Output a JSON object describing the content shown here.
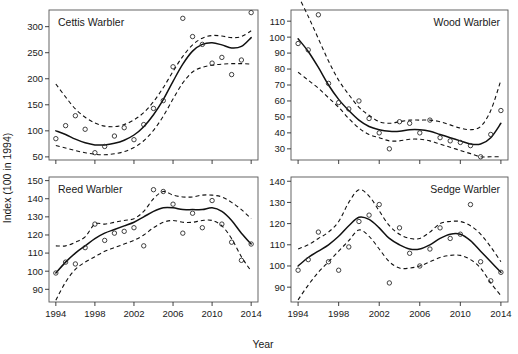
{
  "figure": {
    "xlabel": "Year",
    "ylabel": "Index (100 in 1994)",
    "background": "#ffffff",
    "line_color": "#111111",
    "point_color": "#2b2b2b"
  },
  "chart_data": [
    {
      "type": "scatter",
      "title": "Cettis Warbler",
      "panel": "top-left",
      "xlabel": "Year",
      "ylabel": "Index (100 in 1994)",
      "xlim": [
        1993.3,
        2014.7
      ],
      "ylim": [
        44,
        332
      ],
      "xticks": [
        1994,
        1998,
        2002,
        2006,
        2010,
        2014
      ],
      "yticks": [
        50,
        100,
        150,
        200,
        250,
        300
      ],
      "grid": false,
      "legend": "none",
      "x": [
        1994,
        1995,
        1996,
        1997,
        1998,
        1999,
        2000,
        2001,
        2002,
        2003,
        2004,
        2005,
        2006,
        2007,
        2008,
        2009,
        2010,
        2011,
        2012,
        2013,
        2014
      ],
      "points": [
        85,
        110,
        129,
        103,
        58,
        70,
        90,
        106,
        83,
        112,
        143,
        158,
        223,
        316,
        281,
        266,
        230,
        241,
        208,
        236,
        327
      ],
      "fit": [
        100,
        93,
        84,
        77,
        73,
        73,
        76,
        82,
        92,
        108,
        131,
        160,
        195,
        228,
        253,
        266,
        269,
        265,
        259,
        262,
        279
      ],
      "ci_upper": [
        190,
        165,
        142,
        126,
        115,
        109,
        108,
        112,
        121,
        135,
        156,
        183,
        214,
        243,
        265,
        278,
        283,
        282,
        279,
        281,
        292
      ],
      "ci_lower": [
        72,
        67,
        62,
        58,
        55,
        54,
        56,
        60,
        68,
        81,
        101,
        128,
        161,
        192,
        213,
        222,
        226,
        228,
        229,
        229,
        228
      ]
    },
    {
      "type": "scatter",
      "title": "Wood Warbler",
      "panel": "top-right",
      "xlabel": "Year",
      "ylabel": "Index (100 in 1994)",
      "xlim": [
        1993.3,
        2014.7
      ],
      "ylim": [
        23,
        117
      ],
      "xticks": [
        1994,
        1998,
        2002,
        2006,
        2010,
        2014
      ],
      "yticks": [
        30,
        40,
        50,
        60,
        70,
        80,
        90,
        100,
        110
      ],
      "grid": false,
      "legend": "none",
      "x": [
        1994,
        1995,
        1996,
        1997,
        1998,
        1999,
        2000,
        2001,
        2002,
        2003,
        2004,
        2005,
        2006,
        2007,
        2008,
        2009,
        2010,
        2011,
        2012,
        2013,
        2014
      ],
      "points": [
        96,
        92,
        114,
        71,
        59,
        55,
        60,
        49,
        40,
        30,
        47,
        46,
        40,
        48,
        37,
        35,
        34,
        32,
        25,
        39,
        54
      ],
      "fit": [
        99,
        91,
        81,
        70,
        61,
        54,
        48,
        44,
        42,
        41,
        41,
        42,
        42,
        41,
        39,
        37,
        35,
        33,
        33,
        37,
        46
      ],
      "ci_upper": [
        126,
        113,
        99,
        85,
        73,
        64,
        56,
        51,
        47,
        46,
        47,
        48,
        48,
        48,
        47,
        45,
        43,
        42,
        44,
        54,
        73
      ],
      "ci_lower": [
        78,
        73,
        68,
        62,
        56,
        49,
        43,
        39,
        37,
        35,
        35,
        36,
        36,
        35,
        33,
        31,
        29,
        27,
        25,
        25,
        25
      ]
    },
    {
      "type": "scatter",
      "title": "Reed Warbler",
      "panel": "bottom-left",
      "xlabel": "Year",
      "ylabel": "Index (100 in 1994)",
      "xlim": [
        1993.3,
        2014.7
      ],
      "ylim": [
        83,
        152
      ],
      "xticks": [
        1994,
        1998,
        2002,
        2006,
        2010,
        2014
      ],
      "yticks": [
        90,
        100,
        110,
        120,
        130,
        140,
        150
      ],
      "grid": false,
      "legend": "none",
      "x": [
        1994,
        1995,
        1996,
        1997,
        1998,
        1999,
        2000,
        2001,
        2002,
        2003,
        2004,
        2005,
        2006,
        2007,
        2008,
        2009,
        2010,
        2011,
        2012,
        2013,
        2014
      ],
      "points": [
        99,
        105,
        104,
        113,
        126,
        117,
        121,
        122,
        124,
        114,
        145,
        144,
        137,
        121,
        132,
        124,
        139,
        126,
        116,
        106,
        115
      ],
      "fit": [
        99,
        105,
        110,
        114,
        118,
        121,
        123,
        125,
        127,
        130,
        133,
        135,
        135,
        134,
        134,
        134,
        135,
        133,
        128,
        121,
        115
      ],
      "ci_upper": [
        114,
        114,
        116,
        119,
        126,
        126,
        127,
        128,
        129,
        133,
        140,
        144,
        142,
        141,
        141,
        142,
        142,
        141,
        138,
        134,
        129
      ],
      "ci_lower": [
        84,
        94,
        101,
        105,
        108,
        111,
        113,
        115,
        117,
        120,
        124,
        127,
        128,
        127,
        127,
        128,
        128,
        125,
        118,
        108,
        100
      ]
    },
    {
      "type": "scatter",
      "title": "Sedge Warbler",
      "panel": "bottom-right",
      "xlabel": "Year",
      "ylabel": "Index (100 in 1994)",
      "xlim": [
        1993.3,
        2014.7
      ],
      "ylim": [
        83,
        142
      ],
      "xticks": [
        1994,
        1998,
        2002,
        2006,
        2010,
        2014
      ],
      "yticks": [
        90,
        100,
        110,
        120,
        130,
        140
      ],
      "grid": false,
      "legend": "none",
      "x": [
        1994,
        1995,
        1996,
        1997,
        1998,
        1999,
        2000,
        2001,
        2002,
        2003,
        2004,
        2005,
        2006,
        2007,
        2008,
        2009,
        2010,
        2011,
        2012,
        2013,
        2014
      ],
      "points": [
        98,
        103,
        116,
        102,
        98,
        109,
        121,
        124,
        129,
        92,
        118,
        106,
        100,
        108,
        118,
        113,
        115,
        129,
        102,
        93,
        97
      ],
      "fit": [
        100,
        104,
        107,
        110,
        114,
        119,
        123,
        122,
        118,
        113,
        110,
        108,
        108,
        110,
        113,
        115,
        115,
        112,
        107,
        102,
        97
      ],
      "ci_upper": [
        108,
        110,
        113,
        116,
        121,
        130,
        136,
        133,
        126,
        119,
        115,
        113,
        113,
        116,
        120,
        121,
        121,
        119,
        115,
        109,
        102
      ],
      "ci_lower": [
        84,
        91,
        97,
        102,
        107,
        112,
        117,
        114,
        108,
        102,
        99,
        99,
        100,
        102,
        104,
        105,
        105,
        103,
        99,
        92,
        86
      ]
    }
  ]
}
